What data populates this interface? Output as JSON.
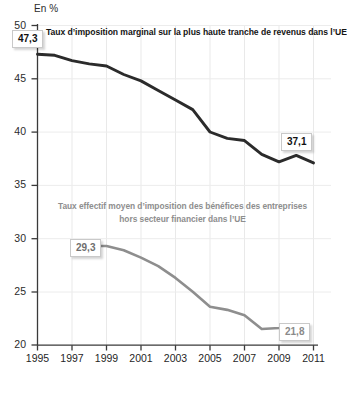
{
  "chart_data": {
    "type": "line",
    "title": "",
    "unit_label": "En %",
    "xlabel": "",
    "ylabel": "",
    "xlim": [
      1995,
      2011
    ],
    "ylim": [
      20,
      50
    ],
    "grid": true,
    "legend_position": "inline-annotation",
    "yticks": [
      "50",
      "45",
      "40",
      "35",
      "30",
      "25",
      "20"
    ],
    "ytick_values": [
      50,
      45,
      40,
      35,
      30,
      25,
      20
    ],
    "xticks": [
      "1995",
      "1997",
      "1999",
      "2001",
      "2003",
      "2005",
      "2007",
      "2009",
      "2011"
    ],
    "xtick_values": [
      1995,
      1997,
      1999,
      2001,
      2003,
      2005,
      2007,
      2009,
      2011
    ],
    "series": [
      {
        "name": "Taux d’imposition marginal sur la plus haute tranche de revenus dans l’UE",
        "color": "#2b2b2b",
        "x": [
          1995,
          1996,
          1997,
          1998,
          1999,
          2000,
          2001,
          2002,
          2003,
          2004,
          2005,
          2006,
          2007,
          2008,
          2009,
          2010,
          2011
        ],
        "values": [
          47.3,
          47.2,
          46.7,
          46.4,
          46.2,
          45.4,
          44.8,
          43.9,
          43.0,
          42.1,
          40.0,
          39.4,
          39.2,
          37.9,
          37.2,
          37.8,
          37.1
        ],
        "start_label": "47,3",
        "end_label": "37,1"
      },
      {
        "name": "Taux effectif moyen d’imposition des bénéfices des entreprises hors secteur financier dans l’UE",
        "color": "#8e8e8e",
        "x": [
          1998,
          1999,
          2000,
          2001,
          2002,
          2003,
          2004,
          2005,
          2006,
          2007,
          2008,
          2009,
          2010
        ],
        "values": [
          29.3,
          29.3,
          28.9,
          28.2,
          27.4,
          26.3,
          25.0,
          23.6,
          23.3,
          22.8,
          21.5,
          21.6,
          21.8
        ],
        "start_label": "29,3",
        "end_label": "21,8"
      }
    ],
    "annotations": [
      {
        "name": "series-1-title",
        "text": "Taux d’imposition marginal sur la plus haute tranche de revenus dans l’UE"
      },
      {
        "name": "series-2-title-line1",
        "text": "Taux effectif moyen d’imposition des bénéfices des entreprises"
      },
      {
        "name": "series-2-title-line2",
        "text": "hors secteur financier dans l’UE"
      }
    ]
  },
  "labels": {
    "unit": "En %",
    "series1_title": "Taux d’imposition marginal sur la plus haute tranche de revenus dans l’UE",
    "series2_title_line1": "Taux effectif moyen d’imposition des bénéfices des entreprises",
    "series2_title_line2": "hors secteur financier dans l’UE",
    "series1_start": "47,3",
    "series1_end": "37,1",
    "series2_start": "29,3",
    "series2_end": "21,8",
    "y0": "50",
    "y1": "45",
    "y2": "40",
    "y3": "35",
    "y4": "30",
    "y5": "25",
    "y6": "20",
    "x0": "1995",
    "x1": "1997",
    "x2": "1999",
    "x3": "2001",
    "x4": "2003",
    "x5": "2005",
    "x6": "2007",
    "x7": "2009",
    "x8": "2011"
  },
  "colors": {
    "series1": "#2b2b2b",
    "series2": "#8e8e8e",
    "grid": "#e6e6e6",
    "axis": "#3a3a3a",
    "background": "#ffffff"
  }
}
